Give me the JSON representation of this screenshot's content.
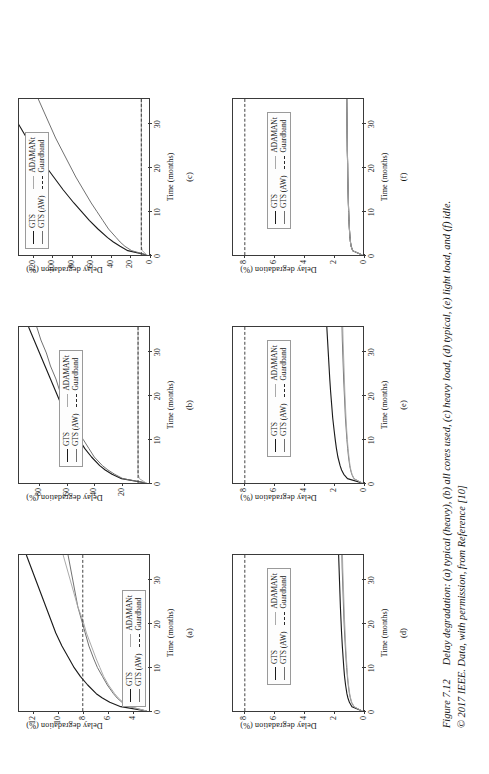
{
  "figure": {
    "number": "Figure 7.12",
    "caption_line1": "Delay degradation: (a) typical (heavy), (b) all cores used, (c) heavy load, (d) typical, (e) light load, and (f) idle.",
    "caption_line2": "© 2017 IEEE. Data, with permission, from Reference [10]"
  },
  "legend_labels": {
    "gts": "GTS",
    "gts_aw": "GTS (AW)",
    "adamant": "ADAMANt",
    "guardband": "Guardband"
  },
  "colors": {
    "gts": "#1b1b1b",
    "gts_aw": "#6f6f6f",
    "adamant": "#a9a9a9",
    "guardband": "#2a2a2a",
    "axis": "#3a3a3a"
  },
  "chart_data": [
    {
      "id": "a",
      "type": "line",
      "panel_label": "(a)",
      "title": "typical (heavy)",
      "xlabel": "Time (months)",
      "ylabel": "Delay degradation (%)",
      "xlim": [
        0,
        36
      ],
      "ylim": [
        2.6,
        13.2
      ],
      "xticks": [
        0,
        10,
        20,
        30
      ],
      "yticks": [
        4,
        6,
        8,
        10,
        12
      ],
      "grid": false,
      "legend_position": "bottom-left",
      "x": [
        0,
        1,
        2,
        3,
        4,
        6,
        8,
        10,
        12,
        15,
        18,
        21,
        24,
        27,
        30,
        33,
        36
      ],
      "series": [
        {
          "name": "GTS",
          "values": [
            2.8,
            4.9,
            5.8,
            6.4,
            6.9,
            7.6,
            8.2,
            8.7,
            9.1,
            9.7,
            10.2,
            10.6,
            11.0,
            11.4,
            11.8,
            12.2,
            12.6
          ]
        },
        {
          "name": "GTS (AW)",
          "values": [
            2.8,
            4.2,
            4.8,
            5.2,
            5.5,
            6.0,
            6.4,
            6.8,
            7.1,
            7.5,
            7.8,
            8.1,
            8.4,
            8.6,
            8.8,
            9.0,
            9.2
          ]
        },
        {
          "name": "ADAMANt",
          "values": [
            2.8,
            4.1,
            4.7,
            5.1,
            5.4,
            5.9,
            6.3,
            6.6,
            6.9,
            7.3,
            7.7,
            8.0,
            8.4,
            8.7,
            9.0,
            9.3,
            9.6
          ]
        },
        {
          "name": "Guardband",
          "values": [
            8,
            8,
            8,
            8,
            8,
            8,
            8,
            8,
            8,
            8,
            8,
            8,
            8,
            8,
            8,
            8,
            8
          ]
        }
      ]
    },
    {
      "id": "b",
      "type": "line",
      "panel_label": "(b)",
      "title": "all cores used",
      "xlabel": "Time (months)",
      "ylabel": "Delay degradation (%)",
      "xlim": [
        0,
        36
      ],
      "ylim": [
        0,
        95
      ],
      "xticks": [
        0,
        10,
        20,
        30
      ],
      "yticks": [
        20,
        40,
        60,
        80
      ],
      "grid": false,
      "legend_position": "center-left",
      "x": [
        0,
        1,
        2,
        3,
        4,
        6,
        8,
        10,
        12,
        15,
        18,
        21,
        24,
        27,
        30,
        33,
        36
      ],
      "series": [
        {
          "name": "GTS",
          "values": [
            2,
            20,
            27,
            32,
            36,
            42,
            47,
            51,
            55,
            60,
            64,
            68,
            72,
            76,
            80,
            84,
            88
          ]
        },
        {
          "name": "GTS (AW)",
          "values": [
            2,
            19,
            25,
            30,
            34,
            40,
            44,
            48,
            52,
            57,
            61,
            65,
            68,
            72,
            75,
            79,
            82
          ]
        },
        {
          "name": "ADAMANt",
          "values": [
            2,
            7,
            8,
            8,
            8,
            8,
            8,
            8,
            8,
            8,
            8,
            8,
            8,
            8,
            8,
            8,
            8
          ]
        },
        {
          "name": "Guardband",
          "values": [
            8,
            8,
            8,
            8,
            8,
            8,
            8,
            8,
            8,
            8,
            8,
            8,
            8,
            8,
            8,
            8,
            8
          ]
        }
      ]
    },
    {
      "id": "c",
      "type": "line",
      "panel_label": "(c)",
      "title": "heavy load",
      "xlabel": "Time (months)",
      "ylabel": "Delay degradation (%)",
      "xlim": [
        0,
        36
      ],
      "ylim": [
        0,
        135
      ],
      "xticks": [
        0,
        10,
        20,
        30
      ],
      "yticks": [
        0,
        20,
        40,
        60,
        80,
        100,
        120
      ],
      "grid": false,
      "legend_position": "top-left",
      "x": [
        0,
        1,
        2,
        3,
        4,
        6,
        8,
        10,
        12,
        15,
        18,
        21,
        24,
        27,
        30,
        33,
        36
      ],
      "series": [
        {
          "name": "GTS",
          "values": [
            2,
            22,
            30,
            37,
            43,
            53,
            62,
            70,
            78,
            89,
            99,
            109,
            118,
            127,
            135,
            143,
            150
          ]
        },
        {
          "name": "GTS (AW)",
          "values": [
            2,
            18,
            25,
            30,
            34,
            42,
            48,
            54,
            60,
            68,
            76,
            83,
            90,
            97,
            103,
            109,
            115
          ]
        },
        {
          "name": "ADAMANt",
          "values": [
            2,
            7,
            8,
            8,
            8,
            8,
            8,
            8,
            8,
            8,
            8,
            8,
            8,
            8,
            8,
            8,
            8
          ]
        },
        {
          "name": "Guardband",
          "values": [
            8,
            8,
            8,
            8,
            8,
            8,
            8,
            8,
            8,
            8,
            8,
            8,
            8,
            8,
            8,
            8,
            8
          ]
        }
      ]
    },
    {
      "id": "d",
      "type": "line",
      "panel_label": "(d)",
      "title": "typical",
      "xlabel": "Time (months)",
      "ylabel": "Delay degradation (%)",
      "xlim": [
        0,
        36
      ],
      "ylim": [
        0,
        8.8
      ],
      "xticks": [
        0,
        10,
        20,
        30
      ],
      "yticks": [
        0,
        2,
        4,
        6,
        8
      ],
      "grid": false,
      "legend_position": "center",
      "x": [
        0,
        1,
        2,
        3,
        4,
        6,
        8,
        10,
        12,
        15,
        18,
        21,
        24,
        27,
        30,
        33,
        36
      ],
      "series": [
        {
          "name": "GTS",
          "values": [
            0.05,
            0.75,
            0.92,
            1.02,
            1.09,
            1.18,
            1.25,
            1.3,
            1.34,
            1.4,
            1.45,
            1.49,
            1.53,
            1.56,
            1.59,
            1.62,
            1.65
          ]
        },
        {
          "name": "GTS (AW)",
          "values": [
            0.05,
            0.62,
            0.78,
            0.86,
            0.92,
            1.0,
            1.06,
            1.11,
            1.15,
            1.2,
            1.25,
            1.29,
            1.32,
            1.35,
            1.38,
            1.41,
            1.43
          ]
        },
        {
          "name": "ADAMANt",
          "values": [
            0.05,
            0.6,
            0.76,
            0.84,
            0.9,
            0.98,
            1.04,
            1.08,
            1.12,
            1.17,
            1.21,
            1.25,
            1.28,
            1.31,
            1.34,
            1.37,
            1.39
          ]
        },
        {
          "name": "Guardband",
          "values": [
            8,
            8,
            8,
            8,
            8,
            8,
            8,
            8,
            8,
            8,
            8,
            8,
            8,
            8,
            8,
            8,
            8
          ]
        }
      ]
    },
    {
      "id": "e",
      "type": "line",
      "panel_label": "(e)",
      "title": "light load",
      "xlabel": "Time (months)",
      "ylabel": "Delay degradation (%)",
      "xlim": [
        0,
        36
      ],
      "ylim": [
        0,
        8.8
      ],
      "xticks": [
        0,
        10,
        20,
        30
      ],
      "yticks": [
        0,
        2,
        4,
        6,
        8
      ],
      "grid": false,
      "legend_position": "center",
      "x": [
        0,
        1,
        2,
        3,
        4,
        6,
        8,
        10,
        12,
        15,
        18,
        21,
        24,
        27,
        30,
        33,
        36
      ],
      "series": [
        {
          "name": "GTS",
          "values": [
            0.05,
            1.05,
            1.3,
            1.45,
            1.55,
            1.7,
            1.8,
            1.88,
            1.95,
            2.05,
            2.12,
            2.19,
            2.25,
            2.3,
            2.35,
            2.4,
            2.45
          ]
        },
        {
          "name": "GTS (AW)",
          "values": [
            0.05,
            0.62,
            0.76,
            0.84,
            0.9,
            0.98,
            1.04,
            1.09,
            1.13,
            1.19,
            1.23,
            1.27,
            1.31,
            1.34,
            1.37,
            1.4,
            1.42
          ]
        },
        {
          "name": "ADAMANt",
          "values": [
            0.05,
            0.6,
            0.74,
            0.82,
            0.88,
            0.95,
            1.01,
            1.06,
            1.1,
            1.15,
            1.19,
            1.23,
            1.26,
            1.29,
            1.32,
            1.35,
            1.37
          ]
        },
        {
          "name": "Guardband",
          "values": [
            8,
            8,
            8,
            8,
            8,
            8,
            8,
            8,
            8,
            8,
            8,
            8,
            8,
            8,
            8,
            8,
            8
          ]
        }
      ]
    },
    {
      "id": "f",
      "type": "line",
      "panel_label": "(f)",
      "title": "idle",
      "xlabel": "Time (months)",
      "ylabel": "Delay degradation (%)",
      "xlim": [
        0,
        36
      ],
      "ylim": [
        0,
        8.8
      ],
      "xticks": [
        0,
        10,
        20,
        30
      ],
      "yticks": [
        0,
        2,
        4,
        6,
        8
      ],
      "grid": false,
      "legend_position": "center",
      "x": [
        0,
        1,
        2,
        3,
        4,
        6,
        8,
        10,
        12,
        15,
        18,
        21,
        24,
        27,
        30,
        33,
        36
      ],
      "series": [
        {
          "name": "GTS",
          "values": [
            0.05,
            0.7,
            0.8,
            0.85,
            0.88,
            0.92,
            0.95,
            0.97,
            0.99,
            1.01,
            1.03,
            1.04,
            1.06,
            1.07,
            1.08,
            1.09,
            1.1
          ]
        },
        {
          "name": "GTS (AW)",
          "values": [
            0.05,
            0.7,
            0.8,
            0.85,
            0.88,
            0.92,
            0.95,
            0.97,
            0.99,
            1.01,
            1.03,
            1.04,
            1.06,
            1.07,
            1.08,
            1.09,
            1.1
          ]
        },
        {
          "name": "ADAMANt",
          "values": [
            0.05,
            0.7,
            0.8,
            0.85,
            0.88,
            0.92,
            0.95,
            0.97,
            0.99,
            1.01,
            1.03,
            1.04,
            1.06,
            1.07,
            1.08,
            1.09,
            1.1
          ]
        },
        {
          "name": "Guardband",
          "values": [
            8,
            8,
            8,
            8,
            8,
            8,
            8,
            8,
            8,
            8,
            8,
            8,
            8,
            8,
            8,
            8,
            8
          ]
        }
      ]
    }
  ]
}
